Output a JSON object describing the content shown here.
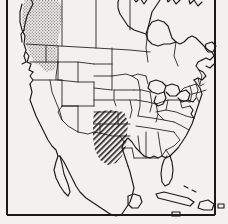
{
  "figure": {
    "type": "distribution-map",
    "region": "North America",
    "background_color": "#f2f1ee",
    "line_color": "#1a1a1a",
    "frame": {
      "present_edges": [
        "left",
        "right",
        "bottom"
      ],
      "top_edge_clipped": true,
      "color": "#1a1a1a",
      "width_px": 2
    },
    "shaded_regions": [
      {
        "name": "pacific-northwest-range",
        "pattern": "stipple",
        "pattern_color": "#7d7d7d",
        "approx_bbox_px": [
          22,
          0,
          40,
          70
        ],
        "covers": "British Columbia, Washington, Oregon, northern California, Idaho"
      },
      {
        "name": "south-central-range",
        "pattern": "diagonal-hatch",
        "pattern_color": "#2b2b2b",
        "approx_bbox_px": [
          93,
          110,
          35,
          55
        ],
        "covers": "Kansas, Oklahoma, Texas, Arkansas, Louisiana, Missouri"
      }
    ],
    "landmasses": [
      "Canada",
      "United States",
      "Mexico",
      "Cuba",
      "Hispaniola",
      "Puerto Rico",
      "Yucatan Peninsula",
      "Baja California",
      "Florida Peninsula",
      "Great Lakes"
    ],
    "internal_boundaries": "state and province outlines",
    "labels": []
  }
}
